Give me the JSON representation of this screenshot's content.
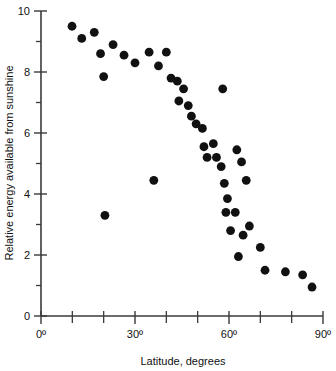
{
  "chart_data": {
    "type": "scatter",
    "title": "",
    "xlabel": "Latitude, degrees",
    "ylabel": "Relative energy available from sunshine",
    "xlim": [
      0,
      90
    ],
    "ylim": [
      0,
      10
    ],
    "grid": false,
    "legend": null,
    "x_ticks": [
      0,
      10,
      20,
      30,
      40,
      50,
      60,
      70,
      80,
      90
    ],
    "x_tick_labels": [
      "0º",
      "",
      "",
      "30º",
      "",
      "",
      "60º",
      "",
      "",
      "90º"
    ],
    "y_ticks": [
      0,
      1,
      2,
      3,
      4,
      5,
      6,
      7,
      8,
      9,
      10
    ],
    "y_tick_labels": [
      "0",
      "",
      "2",
      "",
      "4",
      "",
      "6",
      "",
      "8",
      "",
      "10"
    ],
    "marker": "filled-circle",
    "marker_color": "#111111",
    "marker_size": 4.4,
    "series": [
      {
        "name": "sunshine energy vs latitude",
        "points": [
          [
            9.9,
            9.5
          ],
          [
            13.0,
            9.1
          ],
          [
            17.0,
            9.3
          ],
          [
            19.0,
            8.6
          ],
          [
            20.0,
            7.85
          ],
          [
            20.4,
            3.3
          ],
          [
            23.0,
            8.9
          ],
          [
            26.5,
            8.55
          ],
          [
            30.0,
            8.3
          ],
          [
            34.5,
            8.65
          ],
          [
            36.0,
            4.45
          ],
          [
            37.5,
            8.2
          ],
          [
            40.0,
            8.65
          ],
          [
            41.5,
            7.8
          ],
          [
            43.5,
            7.7
          ],
          [
            44.0,
            7.05
          ],
          [
            45.5,
            7.45
          ],
          [
            47.0,
            6.9
          ],
          [
            48.0,
            6.55
          ],
          [
            49.5,
            6.3
          ],
          [
            51.5,
            6.15
          ],
          [
            52.0,
            5.55
          ],
          [
            53.0,
            5.2
          ],
          [
            55.0,
            5.65
          ],
          [
            56.0,
            5.2
          ],
          [
            57.5,
            4.9
          ],
          [
            58.0,
            7.45
          ],
          [
            58.5,
            4.35
          ],
          [
            59.0,
            3.4
          ],
          [
            59.5,
            3.85
          ],
          [
            60.5,
            2.8
          ],
          [
            62.0,
            3.4
          ],
          [
            62.5,
            5.45
          ],
          [
            63.0,
            1.95
          ],
          [
            64.0,
            5.05
          ],
          [
            64.5,
            2.65
          ],
          [
            65.5,
            4.45
          ],
          [
            66.5,
            2.95
          ],
          [
            70.0,
            2.25
          ],
          [
            71.5,
            1.5
          ],
          [
            78.0,
            1.45
          ],
          [
            83.5,
            1.35
          ],
          [
            86.5,
            0.95
          ]
        ]
      }
    ]
  }
}
